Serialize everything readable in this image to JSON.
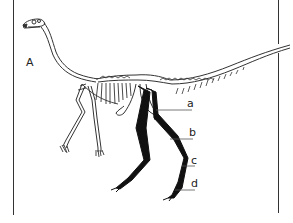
{
  "figure": {
    "panel_label": "A",
    "colors": {
      "background": "#ffffff",
      "outline": "#333333",
      "hindlimb_fill": "#111111"
    },
    "labels": [
      {
        "id": "a",
        "text": "a"
      },
      {
        "id": "b",
        "text": "b"
      },
      {
        "id": "c",
        "text": "c"
      },
      {
        "id": "d",
        "text": "d"
      }
    ]
  }
}
